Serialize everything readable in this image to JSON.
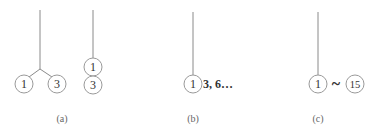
{
  "panels": {
    "a": {
      "caption": "(a)",
      "split_tree": {
        "left_node": "1",
        "right_node": "3"
      },
      "stacked": {
        "top_node": "1",
        "bottom_node": "3"
      }
    },
    "b": {
      "caption": "(b)",
      "node": "1",
      "sequence_text": "3, 6…"
    },
    "c": {
      "caption": "(c)",
      "start_node": "1",
      "range_symbol": "~",
      "end_node": "15"
    }
  }
}
